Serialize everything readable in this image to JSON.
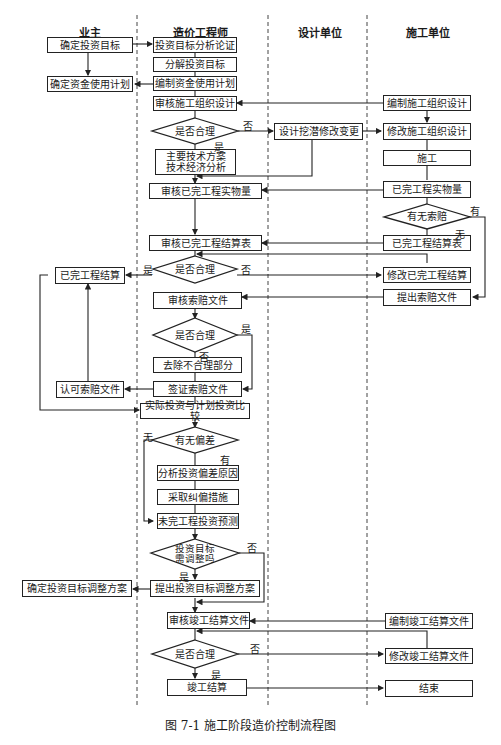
{
  "lanes": [
    "业主",
    "造价工程师",
    "设计单位",
    "施工单位"
  ],
  "boxes": {
    "owner_target": "确定投资目标",
    "owner_fund_plan": "确定资金使用计划",
    "eng_analyze": "投资目标分析论证",
    "eng_decompose": "分解投资目标",
    "eng_fund_plan": "编制资金使用计划",
    "eng_review_org": "审核施工组织设计",
    "eng_tech_plan": "主要技术方案\n技术经济分析",
    "eng_review_qty": "审核已完工程实物量",
    "eng_review_settle": "审核已完工程结算表",
    "eng_review_claim": "审核索赔文件",
    "eng_remove": "去除不合理部分",
    "eng_sign_claim": "签证索赔文件",
    "eng_compare": "实际投资与计划投资比较",
    "eng_analyze_dev": "分析投资偏差原因",
    "eng_correct": "采取纠偏措施",
    "eng_forecast": "未完工程投资预测",
    "eng_propose_adjust": "提出投资目标调整方案",
    "eng_review_final": "审核竣工结算文件",
    "eng_final_settle": "竣工结算",
    "owner_settle": "已完工程结算",
    "owner_approve_claim": "认可索赔文件",
    "owner_adjust": "确定投资目标调整方案",
    "design_change": "设计挖潜修改变更",
    "con_prepare_org": "编制施工组织设计",
    "con_modify_org": "修改施工组织设计",
    "con_build": "施工",
    "con_qty": "已完工程实物量",
    "con_settle_table": "已完工程结算表",
    "con_modify_settle": "修改已完工程结算",
    "con_submit_claim": "提出索赔文件",
    "con_prepare_final": "编制竣工结算文件",
    "con_modify_final": "修改竣工结算文件",
    "con_end": "结束"
  },
  "decisions": {
    "d_reasonable_1": "是否合理",
    "d_claim": "有无索赔",
    "d_reasonable_2": "是否合理",
    "d_reasonable_3": "是否合理",
    "d_deviation": "有无偏差",
    "d_adjust": "投资目标\n需调整吗",
    "d_reasonable_4": "是否合理"
  },
  "labels": {
    "no_1": "否",
    "yes_1": "是",
    "yes_claim": "有",
    "no_claim": "无",
    "yes_2": "是",
    "no_2": "否",
    "yes_3": "是",
    "no_3": "否",
    "none_dev": "无",
    "has_dev": "有",
    "no_adj": "否",
    "yes_adj": "是",
    "no_4": "否",
    "yes_4": "是"
  },
  "caption": "图 7-1   施工阶段造价控制流程图"
}
